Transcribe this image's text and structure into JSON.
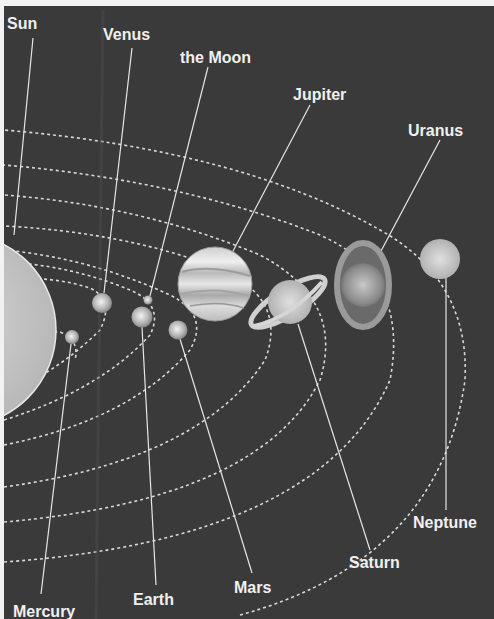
{
  "diagram": {
    "background_color": "#3a3a3a",
    "label_color": "#f0f0f0",
    "bodies": [
      {
        "name": "Sun",
        "label": "Sun"
      },
      {
        "name": "Mercury",
        "label": "Mercury"
      },
      {
        "name": "Venus",
        "label": "Venus"
      },
      {
        "name": "Earth",
        "label": "Earth"
      },
      {
        "name": "Moon",
        "label": "the Moon"
      },
      {
        "name": "Mars",
        "label": "Mars"
      },
      {
        "name": "Jupiter",
        "label": "Jupiter"
      },
      {
        "name": "Saturn",
        "label": "Saturn"
      },
      {
        "name": "Uranus",
        "label": "Uranus"
      },
      {
        "name": "Neptune",
        "label": "Neptune"
      }
    ]
  }
}
